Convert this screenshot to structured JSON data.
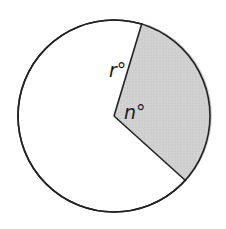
{
  "diagram": {
    "type": "circle-sector",
    "circle": {
      "cx": 114,
      "cy": 116,
      "r": 96,
      "stroke": "#222222",
      "fill": "#ffffff"
    },
    "sector": {
      "fill": "#cfcfcf",
      "start_point": [
        142,
        23
      ],
      "end_point": [
        186,
        181
      ]
    },
    "labels": {
      "r": "r°",
      "n": "n°"
    }
  }
}
